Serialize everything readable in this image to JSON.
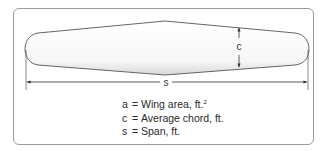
{
  "figure": {
    "labels": {
      "chord": "c",
      "span": "s"
    },
    "legend": [
      {
        "symbol": "a",
        "equals": "=",
        "description": "Wing area, ft.",
        "superscript": "2"
      },
      {
        "symbol": "c",
        "equals": "=",
        "description": "Average chord, ft.",
        "superscript": ""
      },
      {
        "symbol": "s",
        "equals": "=",
        "description": "Span, ft.",
        "superscript": ""
      }
    ],
    "colors": {
      "outline": "#555555",
      "frame": "#9a9a9a",
      "text": "#2a2a2a"
    }
  }
}
